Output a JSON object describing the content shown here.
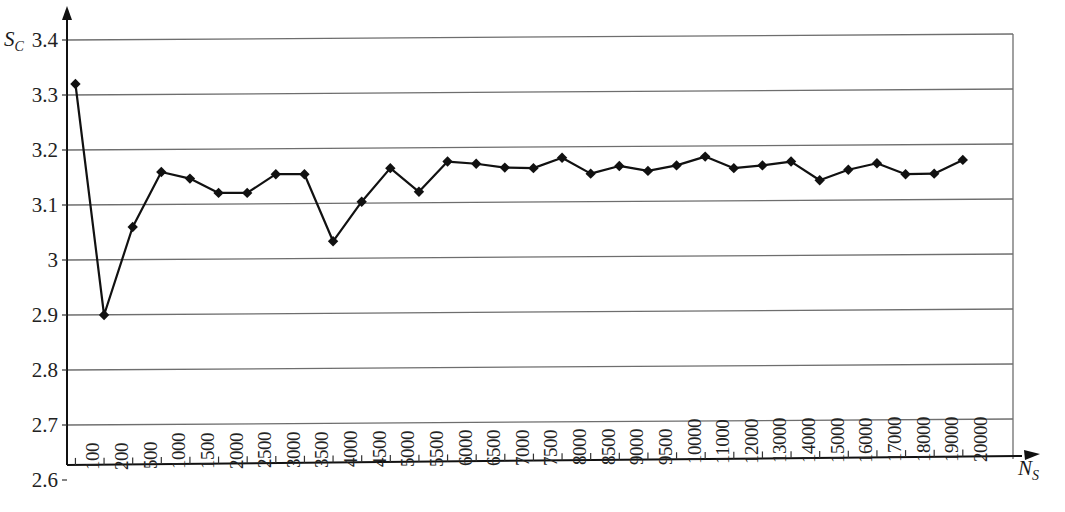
{
  "chart_data": {
    "type": "line",
    "title": "",
    "subtitle": "",
    "xlabel": "N_S",
    "xlabel_base": "N",
    "xlabel_sub": "S",
    "ylabel": "S_C",
    "ylabel_base": "S",
    "ylabel_sub": "C",
    "grid": true,
    "legend": "none",
    "ylim": [
      2.6,
      3.4
    ],
    "yticks": [
      "2.6",
      "2.7",
      "2.8",
      "2.9",
      "3",
      "3.1",
      "3.2",
      "3.3",
      "3.4"
    ],
    "ytick_values": [
      2.6,
      2.7,
      2.8,
      2.9,
      3.0,
      3.1,
      3.2,
      3.3,
      3.4
    ],
    "categories": [
      "100",
      "200",
      "500",
      "1000",
      "1500",
      "2000",
      "2500",
      "3000",
      "3500",
      "4000",
      "4500",
      "5000",
      "5500",
      "6000",
      "6500",
      "7000",
      "7500",
      "8000",
      "8500",
      "9000",
      "9500",
      "10000",
      "11000",
      "12000",
      "13000",
      "14000",
      "15000",
      "16000",
      "17000",
      "18000",
      "19000",
      "20000"
    ],
    "x": [
      100,
      200,
      500,
      1000,
      1500,
      2000,
      2500,
      3000,
      3500,
      4000,
      4500,
      5000,
      5500,
      6000,
      6500,
      7000,
      7500,
      8000,
      8500,
      9000,
      9500,
      10000,
      11000,
      12000,
      13000,
      14000,
      15000,
      16000,
      17000,
      18000,
      19000,
      20000
    ],
    "values": [
      3.32,
      2.9,
      3.06,
      3.16,
      3.148,
      3.122,
      3.122,
      3.156,
      3.156,
      3.034,
      3.106,
      3.167,
      3.124,
      3.179,
      3.175,
      3.168,
      3.167,
      3.186,
      3.157,
      3.171,
      3.162,
      3.172,
      3.188,
      3.167,
      3.172,
      3.179,
      3.145,
      3.164,
      3.176,
      3.156,
      3.157,
      3.182
    ],
    "series": [
      {
        "name": "Sc",
        "marker": "diamond",
        "color": "#111111",
        "values": [
          3.32,
          2.9,
          3.06,
          3.16,
          3.148,
          3.122,
          3.122,
          3.156,
          3.156,
          3.034,
          3.106,
          3.167,
          3.124,
          3.179,
          3.175,
          3.168,
          3.167,
          3.186,
          3.157,
          3.171,
          3.162,
          3.172,
          3.188,
          3.167,
          3.172,
          3.179,
          3.145,
          3.164,
          3.176,
          3.156,
          3.157,
          3.182
        ]
      }
    ]
  }
}
